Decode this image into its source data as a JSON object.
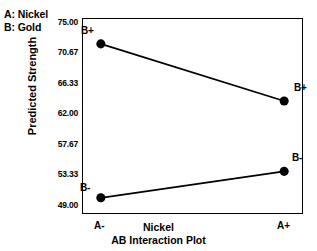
{
  "factor_key": {
    "lines": [
      "A: Nickel",
      "B: Gold"
    ]
  },
  "chart_data": {
    "type": "line",
    "title": "AB Interaction Plot",
    "xlabel": "Nickel",
    "ylabel": "Predicted Strength",
    "categories": [
      "A-",
      "A+"
    ],
    "x_tick_labels": [
      "A-",
      "A+"
    ],
    "y_tick_labels": [
      "75.00",
      "70.67",
      "66.33",
      "62.00",
      "57.67",
      "53.33",
      "49.00"
    ],
    "y_tick_values": [
      75.0,
      70.67,
      66.33,
      62.0,
      57.67,
      53.33,
      49.0
    ],
    "ylim": [
      49.0,
      75.0
    ],
    "grid": false,
    "legend_position": "inline-point-labels",
    "marker": "filled-circle",
    "series": [
      {
        "name": "B+",
        "label_left": "B+",
        "label_right": "B+",
        "values": [
          72.0,
          63.8
        ]
      },
      {
        "name": "B-",
        "label_left": "B-",
        "label_right": "B-",
        "values": [
          49.9,
          53.7
        ]
      }
    ],
    "colors": {
      "line": "#000000",
      "marker": "#000000",
      "axis": "#000000",
      "background": "#ffffff"
    }
  }
}
